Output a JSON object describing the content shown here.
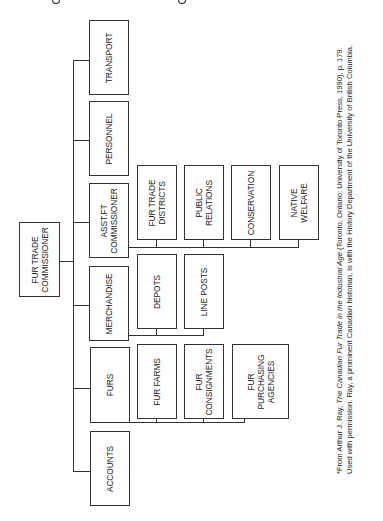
{
  "header": {
    "clipped_title_visible": false
  },
  "chart": {
    "root": {
      "id": "fur-trade-commissioner",
      "label": "FUR TRADE\nCOMMISSIONER"
    },
    "departments": [
      {
        "id": "transport",
        "label": "TRANSPORT",
        "children": []
      },
      {
        "id": "personnel",
        "label": "PERSONNEL",
        "children": []
      },
      {
        "id": "asst-ft-commissioner",
        "label": "ASST.FT\nCOMMISSIONER",
        "children": [
          {
            "id": "fur-trade-districts",
            "label": "FUR TRADE\nDISTRICTS"
          },
          {
            "id": "public-relations",
            "label": "PUBLIC\nRELATIONS"
          },
          {
            "id": "conservation",
            "label": "CONSERVATION"
          },
          {
            "id": "native-welfare",
            "label": "NATIVE\nWELFARE"
          }
        ]
      },
      {
        "id": "merchandise",
        "label": "MERCHANDISE",
        "children": [
          {
            "id": "depots",
            "label": "DEPOTS"
          },
          {
            "id": "line-posts",
            "label": "LINE POSTS"
          }
        ]
      },
      {
        "id": "furs",
        "label": "FURS",
        "children": [
          {
            "id": "fur-farms",
            "label": "FUR FARMS"
          },
          {
            "id": "fur-consignments",
            "label": "FUR\nCONSIGNMENTS"
          },
          {
            "id": "fur-purchasing-agencies",
            "label": "FUR\nPURCHASING\nAGENCIES"
          }
        ]
      },
      {
        "id": "accounts",
        "label": "ACCOUNTS",
        "children": []
      }
    ]
  },
  "footnote": {
    "prefix": "*From Arthur J. Ray, ",
    "title": "The Canadian Fur Trade in the Industrial Age",
    "suffix": " (Toronto, Ontario: University of Toronto Press, 1990), p. 179. Used with permission. Ray, a prominent Canadian historian, is with the History Department of the University of British Columbia."
  }
}
